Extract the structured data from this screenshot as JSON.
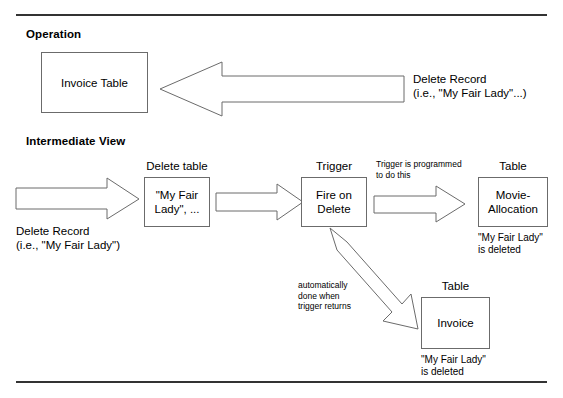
{
  "diagram": {
    "sections": [
      {
        "title": "Operation"
      },
      {
        "title": "Intermediate View"
      }
    ],
    "operation": {
      "box_label": "Invoice Table",
      "arrow_name": "delete-record-arrow-left",
      "arrow_caption": "Delete Record\n(i.e., \"My Fair Lady\"...)"
    },
    "intermediate": {
      "input_arrow_caption": "Delete Record\n(i.e., \"My Fair Lady\")",
      "delete_table": {
        "title": "Delete table",
        "content": "\"My Fair\nLady\", ..."
      },
      "trigger": {
        "title": "Trigger",
        "content": "Fire on\nDelete"
      },
      "trigger_arrow_note": "Trigger is programmed\nto do this",
      "movie_allocation": {
        "title": "Table",
        "content": "Movie-\nAllocation",
        "caption": "\"My Fair Lady\"\nis deleted"
      },
      "invoice": {
        "title": "Table",
        "content": "Invoice",
        "caption": "\"My Fair Lady\"\nis deleted"
      },
      "diagonal_arrow_note": "automatically\ndone when\ntrigger returns"
    }
  },
  "colors": {
    "stroke": "#6b6b6b",
    "rule": "#333333",
    "text": "#000000",
    "background": "#ffffff"
  }
}
